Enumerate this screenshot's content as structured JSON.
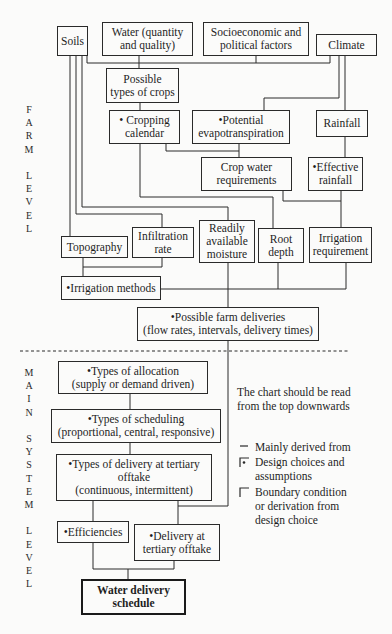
{
  "side_labels": {
    "farm_level": "F\nA\nR\nM\n\nL\nE\nV\nE\nL",
    "main_system_level": "M\nA\nI\nN\n\nS\nY\nS\nT\nE\nM\n\nL\nE\nV\nE\nL"
  },
  "farm_level": {
    "soils": "Soils",
    "water": "Water (quantity\nand quality)",
    "socioeconomic": "Socioeconomic and\npolitical factors",
    "climate": "Climate",
    "possible_crops": "Possible\ntypes of crops",
    "cropping_calendar": "• Cropping\ncalendar",
    "potential_evapotranspiration": "•Potential\nevapotranspiration",
    "rainfall": "Rainfall",
    "crop_water_requirements": "Crop water\nrequirements",
    "effective_rainfall": "•Effective\nrainfall",
    "topography": "Topography",
    "infiltration_rate": "Infiltration\nrate",
    "readily_available_moisture": "Readily\navailable\nmoisture",
    "root_depth": "Root\ndepth",
    "irrigation_requirement": "Irrigation\nrequirement",
    "irrigation_methods": "•Irrigation methods",
    "possible_farm_deliveries": "•Possible farm deliveries\n(flow rates, intervals, delivery times)"
  },
  "main_system_level": {
    "types_of_allocation": "•Types of allocation\n(supply or demand driven)",
    "types_of_scheduling": "•Types of scheduling\n(proportional, central, responsive)",
    "types_of_delivery": "•Types of delivery at tertiary\nofftake\n(continuous, intermittent)",
    "efficiencies": "•Efficiencies",
    "delivery_at_tertiary_offtake": "•Delivery at\ntertiary offtake",
    "water_delivery_schedule": "Water delivery\nschedule"
  },
  "reading_note": "The chart should be read\nfrom the top downwards",
  "legend": [
    {
      "icon": "line-icon",
      "label": "Mainly derived from"
    },
    {
      "icon": "dot-corner-icon",
      "label": "Design choices and\nassumptions"
    },
    {
      "icon": "corner-icon",
      "label": "Boundary condition\nor derivation from\ndesign choice"
    }
  ],
  "colors": {
    "line": "#2a2a2a",
    "background": "#fbfbfa",
    "text": "#1e1e1e"
  }
}
